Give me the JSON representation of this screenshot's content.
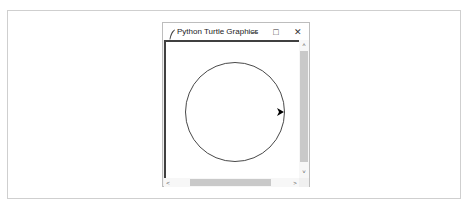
{
  "window": {
    "title": "Python Turtle Graphics",
    "app_icon": "feather-icon",
    "controls": {
      "minimize": "–",
      "maximize": "□",
      "close": "✕"
    }
  },
  "canvas": {
    "background": "#ffffff",
    "shapes": [
      {
        "type": "circle",
        "cx": 69,
        "cy": 70,
        "r": 49.5,
        "stroke": "#333333"
      }
    ],
    "turtle": {
      "shape": "arrow",
      "x": 116,
      "y": 70,
      "heading": "right",
      "color": "#000000"
    }
  },
  "scrollbars": {
    "vertical": {
      "up": "˄",
      "down": "˅"
    },
    "horizontal": {
      "left": "<",
      "right": ">"
    }
  }
}
